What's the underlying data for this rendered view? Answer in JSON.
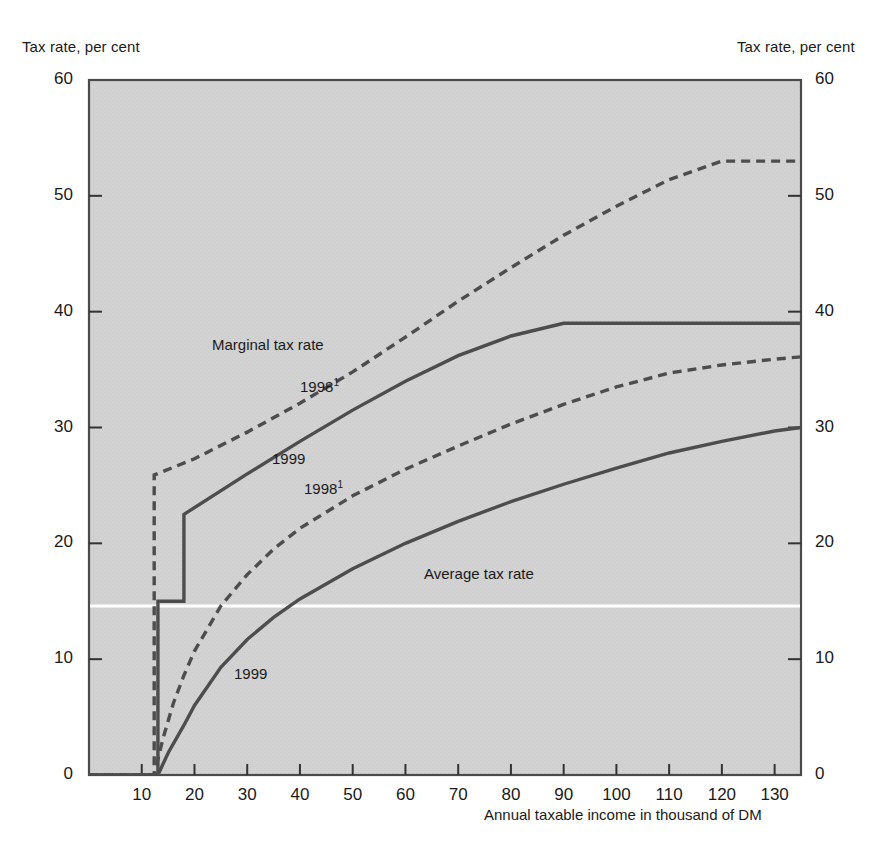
{
  "axis_captions": {
    "left": "Tax rate, per cent",
    "right": "Tax rate, per cent"
  },
  "annotations": {
    "marginal_group": "Marginal tax rate",
    "average_group": "Average tax rate",
    "marginal_1998": "1998",
    "marginal_1998_note": "1",
    "marginal_1999": "1999",
    "average_1998": "1998",
    "average_1998_note": "1",
    "average_1999": "1999"
  },
  "colors": {
    "plot_background": "#d2d2d2",
    "line": "#4d4d4d",
    "axis": "#333333",
    "reference_line": "#ffffff",
    "text": "#1a1a1a"
  },
  "chart_data": {
    "type": "line",
    "title": "",
    "subtitle": "",
    "xlabel": "Annual taxable income in thousand of DM",
    "ylabel": "Tax rate, per cent",
    "xlim": [
      0,
      135
    ],
    "ylim": [
      0,
      60
    ],
    "xticks": [
      10,
      20,
      30,
      40,
      50,
      60,
      70,
      80,
      90,
      100,
      110,
      120,
      130
    ],
    "yticks": [
      0,
      10,
      20,
      30,
      40,
      50,
      60
    ],
    "xtick_labels": [
      "10",
      "20",
      "30",
      "40",
      "50",
      "60",
      "70",
      "80",
      "90",
      "100",
      "110",
      "120",
      "130"
    ],
    "ytick_labels": [
      "0",
      "10",
      "20",
      "30",
      "40",
      "50",
      "60"
    ],
    "grid": false,
    "legend_position": "inline-annotations",
    "reference_lines": [
      {
        "orientation": "horizontal",
        "value": 14.6,
        "color": "#ffffff"
      }
    ],
    "series": [
      {
        "name": "Marginal tax rate 1998",
        "style": "dashed",
        "group": "Marginal tax rate",
        "year": "1998",
        "points": [
          [
            0,
            0
          ],
          [
            12.36,
            0
          ],
          [
            12.36,
            25.9
          ],
          [
            20,
            27.3
          ],
          [
            30,
            29.6
          ],
          [
            40,
            32.1
          ],
          [
            50,
            34.8
          ],
          [
            60,
            37.8
          ],
          [
            70,
            40.9
          ],
          [
            80,
            43.8
          ],
          [
            90,
            46.6
          ],
          [
            100,
            49.1
          ],
          [
            110,
            51.4
          ],
          [
            120,
            53.0
          ],
          [
            130,
            53.0
          ],
          [
            135,
            53.0
          ]
        ]
      },
      {
        "name": "Marginal tax rate 1999",
        "style": "solid",
        "group": "Marginal tax rate",
        "year": "1999",
        "points": [
          [
            0,
            0
          ],
          [
            13.07,
            0
          ],
          [
            13.07,
            15.0
          ],
          [
            18.0,
            15.0
          ],
          [
            18.0,
            22.5
          ],
          [
            30,
            26.0
          ],
          [
            40,
            28.8
          ],
          [
            50,
            31.5
          ],
          [
            60,
            34.0
          ],
          [
            70,
            36.2
          ],
          [
            80,
            37.9
          ],
          [
            90,
            39.0
          ],
          [
            100,
            39.0
          ],
          [
            110,
            39.0
          ],
          [
            120,
            39.0
          ],
          [
            135,
            39.0
          ]
        ]
      },
      {
        "name": "Average tax rate 1998",
        "style": "dashed",
        "group": "Average tax rate",
        "year": "1998",
        "points": [
          [
            0,
            0
          ],
          [
            12.36,
            0
          ],
          [
            14,
            3.1
          ],
          [
            16,
            6.2
          ],
          [
            18,
            8.6
          ],
          [
            20,
            10.7
          ],
          [
            25,
            14.6
          ],
          [
            30,
            17.3
          ],
          [
            35,
            19.5
          ],
          [
            40,
            21.3
          ],
          [
            50,
            24.1
          ],
          [
            60,
            26.4
          ],
          [
            70,
            28.4
          ],
          [
            80,
            30.3
          ],
          [
            90,
            32.0
          ],
          [
            100,
            33.5
          ],
          [
            110,
            34.7
          ],
          [
            120,
            35.4
          ],
          [
            130,
            35.9
          ],
          [
            135,
            36.1
          ]
        ]
      },
      {
        "name": "Average tax rate 1999",
        "style": "solid",
        "group": "Average tax rate",
        "year": "1999",
        "points": [
          [
            0,
            0
          ],
          [
            13.07,
            0
          ],
          [
            15,
            1.9
          ],
          [
            18,
            4.3
          ],
          [
            20,
            6.0
          ],
          [
            25,
            9.3
          ],
          [
            30,
            11.7
          ],
          [
            35,
            13.6
          ],
          [
            40,
            15.2
          ],
          [
            50,
            17.8
          ],
          [
            60,
            20.0
          ],
          [
            70,
            21.9
          ],
          [
            80,
            23.6
          ],
          [
            90,
            25.1
          ],
          [
            100,
            26.5
          ],
          [
            110,
            27.8
          ],
          [
            120,
            28.8
          ],
          [
            130,
            29.7
          ],
          [
            135,
            30.0
          ]
        ]
      }
    ]
  }
}
